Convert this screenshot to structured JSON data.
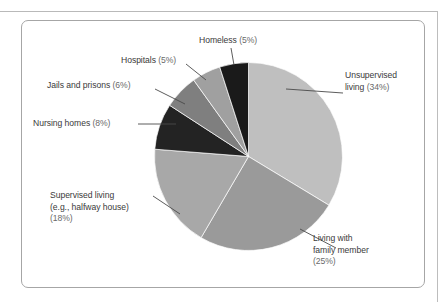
{
  "figure": {
    "frame_color": "#a6a6a6",
    "background": "#ffffff",
    "label_color": "#3a3a3a",
    "percent_color": "#6a6a6a"
  },
  "chart_data": {
    "type": "pie",
    "title": "",
    "subtitle": "",
    "xlabel": "",
    "ylabel": "",
    "legend_position": "none",
    "grid": false,
    "labels_are_callouts": true,
    "total_percent": 101,
    "start_angle_deg": 0,
    "direction": "clockwise",
    "categories": [
      "Unsupervised living",
      "Living with family member",
      "Supervised living (e.g., halfway house)",
      "Nursing homes",
      "Jails and prisons",
      "Hospitals",
      "Homeless"
    ],
    "values": [
      34,
      25,
      18,
      8,
      6,
      5,
      5
    ],
    "colors": [
      "#bfbfbf",
      "#9a9a9a",
      "#a8a8a8",
      "#232323",
      "#7f7f7f",
      "#a0a0a0",
      "#1a1a1a"
    ],
    "slices": [
      {
        "name": "Unsupervised living",
        "value": 34,
        "percent_text": "(34%)",
        "label_lines": [
          "Unsupervised",
          "living "
        ],
        "color": "#bfbfbf"
      },
      {
        "name": "Living with family member",
        "value": 25,
        "percent_text": "(25%)",
        "label_lines": [
          "Living with",
          "family member",
          ""
        ],
        "color": "#9a9a9a"
      },
      {
        "name": "Supervised living (e.g., halfway house)",
        "value": 18,
        "percent_text": "(18%)",
        "label_lines": [
          "Supervised living",
          "(e.g., halfway house)",
          ""
        ],
        "color": "#a8a8a8"
      },
      {
        "name": "Nursing homes",
        "value": 8,
        "percent_text": "(8%)",
        "label_lines": [
          "Nursing homes "
        ],
        "color": "#232323"
      },
      {
        "name": "Jails and prisons",
        "value": 6,
        "percent_text": "(6%)",
        "label_lines": [
          "Jails and prisons "
        ],
        "color": "#7f7f7f"
      },
      {
        "name": "Hospitals",
        "value": 5,
        "percent_text": "(5%)",
        "label_lines": [
          "Hospitals "
        ],
        "color": "#a0a0a0"
      },
      {
        "name": "Homeless",
        "value": 5,
        "percent_text": "(5%)",
        "label_lines": [
          "Homeless "
        ],
        "color": "#1a1a1a"
      }
    ]
  },
  "labels": {
    "homeless": {
      "text": "Homeless ",
      "pct": "(5%)"
    },
    "hospitals": {
      "text": "Hospitals ",
      "pct": "(5%)"
    },
    "jails": {
      "text": "Jails and prisons ",
      "pct": "(6%)"
    },
    "nursing": {
      "text": "Nursing homes ",
      "pct": "(8%)"
    },
    "supervised": {
      "line1": "Supervised living",
      "line2": "(e.g., halfway house)",
      "pct": "(18%)"
    },
    "unsupervised": {
      "line1": "Unsupervised",
      "line2": "living ",
      "pct": "(34%)"
    },
    "family": {
      "line1": "Living with",
      "line2": "family member",
      "pct": "(25%)"
    }
  }
}
